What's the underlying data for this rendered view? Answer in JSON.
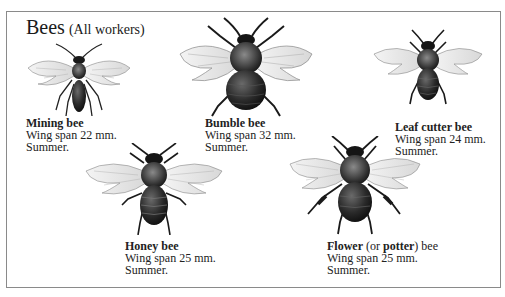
{
  "title": {
    "main": "Bees",
    "sub": "(All workers)"
  },
  "bees": [
    {
      "name": "Mining bee",
      "wingspan": "Wing span 22 mm.",
      "season": "Summer."
    },
    {
      "name": "Bumble bee",
      "wingspan": "Wing span 32 mm.",
      "season": "Summer."
    },
    {
      "name": "Leaf cutter bee",
      "wingspan": "Wing span 24 mm.",
      "season": "Summer."
    },
    {
      "name": "Honey bee",
      "wingspan": "Wing span 25 mm.",
      "season": "Summer."
    },
    {
      "name_parts": [
        "Flower",
        " (or ",
        "potter",
        ") bee"
      ],
      "wingspan": "Wing span 25 mm.",
      "season": "Summer."
    }
  ]
}
